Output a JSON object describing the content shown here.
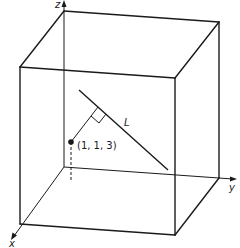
{
  "figure": {
    "axes": {
      "x_label": "x",
      "y_label": "y",
      "z_label": "z"
    },
    "line": {
      "label": "L"
    },
    "point": {
      "label": "(1, 1, 3)"
    },
    "colors": {
      "stroke": "#1a1a1a",
      "background": "#ffffff"
    }
  }
}
